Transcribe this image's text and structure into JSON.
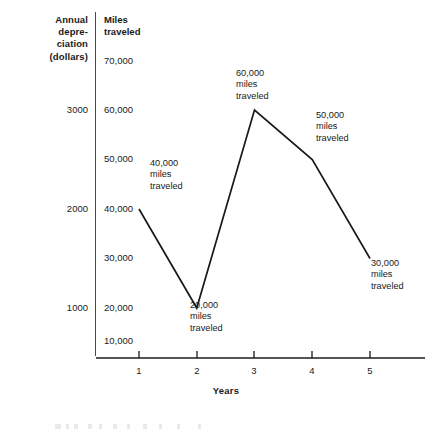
{
  "chart_data": {
    "type": "line",
    "title": "",
    "xlabel": "Years",
    "ylabel": "Miles traveled",
    "ylabel_secondary": "Annual depre- ciation (dollars)",
    "x": [
      1,
      2,
      3,
      4,
      5
    ],
    "categories": [
      "1",
      "2",
      "3",
      "4",
      "5"
    ],
    "values": [
      40000,
      20000,
      60000,
      50000,
      30000
    ],
    "series": [
      {
        "name": "Miles traveled",
        "values": [
          40000,
          20000,
          60000,
          50000,
          30000
        ]
      }
    ],
    "xlim": [
      0,
      5.6
    ],
    "ylim": [
      0,
      75000
    ],
    "grid": false,
    "legend": false,
    "line_color": "#1a1a1a",
    "markers": false,
    "y_ticks": [
      10000,
      20000,
      30000,
      40000,
      50000,
      60000,
      70000
    ],
    "y_tick_labels": [
      "10,000",
      "20,000",
      "30,000",
      "40,000",
      "50,000",
      "60,000",
      "70,000"
    ],
    "y_ticks_secondary": [
      1000,
      2000,
      3000
    ],
    "y_tick_labels_secondary": [
      "1000",
      "2000",
      "3000"
    ],
    "y_secondary_aligned_to": [
      20000,
      40000,
      60000
    ],
    "annotations": [
      {
        "text": "40,000\nmiles\ntraveled",
        "point_x": 1,
        "point_y": 40000
      },
      {
        "text": "20,000\nmiles\ntraveled",
        "point_x": 2,
        "point_y": 20000
      },
      {
        "text": "60,000\nmiles\ntraveled",
        "point_x": 3,
        "point_y": 60000
      },
      {
        "text": "50,000\nmiles\ntraveled",
        "point_x": 4,
        "point_y": 50000
      },
      {
        "text": "30,000\nmiles\ntraveled",
        "point_x": 5,
        "point_y": 30000
      }
    ]
  },
  "axis_left": {
    "heading_line1": "Annual",
    "heading_line2": "depre-",
    "heading_line3": "ciation",
    "heading_line4": "(dollars)",
    "tick_3000": "3000",
    "tick_2000": "2000",
    "tick_1000": "1000"
  },
  "axis_miles": {
    "heading_line1": "Miles",
    "heading_line2": "traveled",
    "tick_70000": "70,000",
    "tick_60000": "60,000",
    "tick_50000": "50,000",
    "tick_40000": "40,000",
    "tick_30000": "30,000",
    "tick_20000": "20,000",
    "tick_10000": "10,000"
  },
  "axis_x": {
    "title": "Years",
    "tick_1": "1",
    "tick_2": "2",
    "tick_3": "3",
    "tick_4": "4",
    "tick_5": "5"
  },
  "annotations": {
    "a1": "40,000\nmiles\ntraveled",
    "a2": "20,000\nmiles\ntraveled",
    "a3": "60,000\nmiles\ntraveled",
    "a4": "50,000\nmiles\ntraveled",
    "a5": "30,000\nmiles\ntraveled"
  },
  "colors": {
    "line": "#1a1a1a",
    "axis": "#1a1a1a",
    "divider": "#4a4a4a",
    "text": "#1a1a1a",
    "background": "#ffffff"
  }
}
